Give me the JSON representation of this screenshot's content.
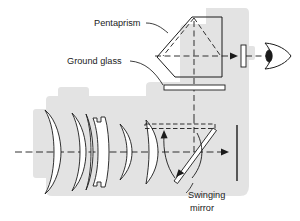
{
  "diagram": {
    "background_color": "#ffffff",
    "body_fill": "#e3e3e3",
    "line_color": "#1b1b1b",
    "labels": {
      "pentaprism": "Pentaprism",
      "ground_glass": "Ground glass",
      "swinging_mirror_line1": "Swinging",
      "swinging_mirror_line2": "mirror"
    },
    "components": [
      {
        "name": "camera-body",
        "label": "camera body"
      },
      {
        "name": "lens-element-1",
        "label": "front meniscus element"
      },
      {
        "name": "lens-element-2",
        "label": "cemented doublet"
      },
      {
        "name": "lens-element-3",
        "label": "meniscus element"
      },
      {
        "name": "lens-element-4",
        "label": "rear convex element"
      },
      {
        "name": "pentaprism",
        "label": "Pentaprism"
      },
      {
        "name": "ground-glass",
        "label": "Ground glass"
      },
      {
        "name": "swinging-mirror",
        "label": "Swinging mirror"
      },
      {
        "name": "mirror-up-position",
        "label": "mirror raised position"
      },
      {
        "name": "film-plane",
        "label": "film plane"
      },
      {
        "name": "eyepiece",
        "label": "eyepiece lens"
      },
      {
        "name": "eye",
        "label": "viewer eye"
      },
      {
        "name": "optical-axis",
        "label": "optical axis"
      }
    ]
  }
}
